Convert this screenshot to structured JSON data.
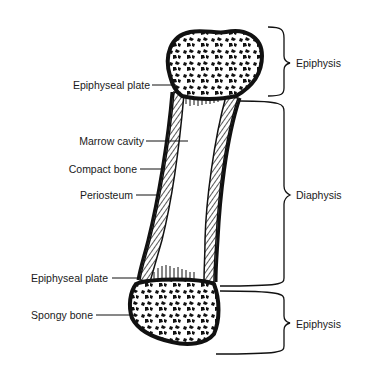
{
  "diagram": {
    "left_labels": [
      {
        "text": "Epiphyseal plate",
        "y": 85
      },
      {
        "text": "Marrow cavity",
        "y": 141
      },
      {
        "text": "Compact bone",
        "y": 169
      },
      {
        "text": "Periosteum",
        "y": 195
      },
      {
        "text": "Epiphyseal plate",
        "y": 278
      },
      {
        "text": "Spongy bone",
        "y": 315
      }
    ],
    "right_labels": [
      {
        "text": "Epiphysis",
        "y": 63
      },
      {
        "text": "Diaphysis",
        "y": 195
      },
      {
        "text": "Epiphysis",
        "y": 324
      }
    ],
    "colors": {
      "ink": "#111111",
      "background": "#ffffff"
    }
  }
}
